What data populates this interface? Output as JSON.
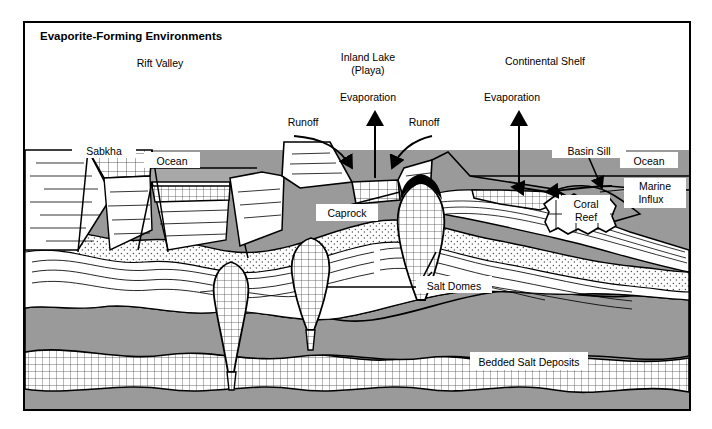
{
  "figure": {
    "title": "Evaporite-Forming Environments",
    "type": "geological-cross-section",
    "frame": {
      "x": 24,
      "y": 22,
      "width": 666,
      "height": 388
    }
  },
  "palette": {
    "background": "#ffffff",
    "frame_stroke": "#000000",
    "gray_fill": "#9a9a9a",
    "ocean_fill": "#a8a8a8",
    "stipple_fill": "#ffffff",
    "salt_fill": "#ffffff",
    "caprock_fill": "#000000",
    "line": "#000000"
  },
  "environments": [
    {
      "id": "rift-valley",
      "label": "Rift Valley",
      "x": 160,
      "y": 67
    },
    {
      "id": "inland-lake",
      "label": "Inland Lake",
      "x": 368,
      "y": 61
    },
    {
      "id": "inland-lake-sub",
      "label": "(Playa)",
      "x": 368,
      "y": 74
    },
    {
      "id": "continental-shelf",
      "label": "Continental Shelf",
      "x": 545,
      "y": 65
    }
  ],
  "process_labels": [
    {
      "id": "evaporation-left",
      "label": "Evaporation",
      "x": 368,
      "y": 101
    },
    {
      "id": "evaporation-right",
      "label": "Evaporation",
      "x": 512,
      "y": 101
    },
    {
      "id": "runoff-left",
      "label": "Runoff",
      "x": 303,
      "y": 126
    },
    {
      "id": "runoff-right",
      "label": "Runoff",
      "x": 424,
      "y": 126
    },
    {
      "id": "marine-influx",
      "label": "Marine",
      "x": 655,
      "y": 186
    },
    {
      "id": "marine-influx-2",
      "label": "Influx",
      "x": 651,
      "y": 199
    }
  ],
  "feature_labels": [
    {
      "id": "sabkha",
      "label": "Sabkha",
      "x": 104,
      "y": 151
    },
    {
      "id": "ocean-left",
      "label": "Ocean",
      "x": 172,
      "y": 161
    },
    {
      "id": "ocean-right",
      "label": "Ocean",
      "x": 651,
      "y": 161
    },
    {
      "id": "basin-sill",
      "label": "Basin Sill",
      "x": 589,
      "y": 151
    },
    {
      "id": "coral-reef",
      "label": "Coral",
      "x": 584,
      "y": 204
    },
    {
      "id": "coral-reef-2",
      "label": "Reef",
      "x": 584,
      "y": 217
    },
    {
      "id": "caprock",
      "label": "Caprock",
      "x": 349,
      "y": 213
    },
    {
      "id": "salt-domes",
      "label": "Salt Domes",
      "x": 450,
      "y": 285
    },
    {
      "id": "bedded-salt",
      "label": "Bedded Salt Deposits",
      "x": 556,
      "y": 361
    }
  ],
  "layers": [
    {
      "id": "ocean-water",
      "name": "Ocean water",
      "fill": "#a8a8a8"
    },
    {
      "id": "sediment-white",
      "name": "Stratified sediment",
      "fill": "#ffffff"
    },
    {
      "id": "stipple-layer",
      "name": "Stippled sand layer",
      "fill": "#ffffff"
    },
    {
      "id": "gray-band",
      "name": "Gray sediment band",
      "fill": "#9a9a9a"
    },
    {
      "id": "bedded-salt-layer",
      "name": "Bedded salt",
      "fill": "#ffffff"
    },
    {
      "id": "basement",
      "name": "Basement rock",
      "fill": "#9a9a9a"
    }
  ],
  "salt_domes": [
    {
      "id": "dome-1",
      "cx": 231,
      "tip_y": 372,
      "top_y": 262
    },
    {
      "id": "dome-2",
      "cx": 311,
      "tip_y": 330,
      "top_y": 238
    },
    {
      "id": "dome-3",
      "cx": 421,
      "tip_y": 300,
      "top_y": 180
    }
  ]
}
